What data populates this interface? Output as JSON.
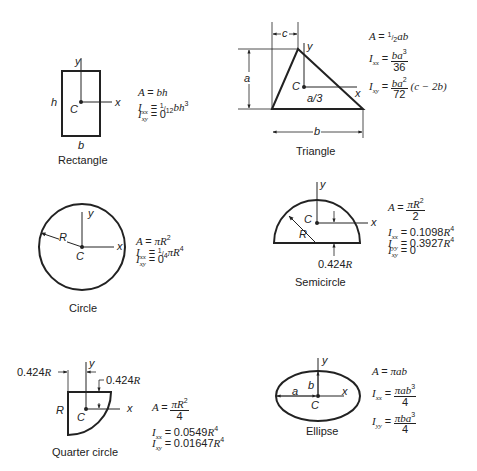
{
  "figure": {
    "shapes": [
      {
        "name": "Rectangle",
        "caption": "Rectangle",
        "labels": {
          "y": "y",
          "x": "x",
          "centroid": "C",
          "height": "h",
          "base": "b"
        },
        "formulas": {
          "A": "A = bh",
          "Ixx": "Ixx = 1/12 bh^3",
          "Ixy": "Ixy = 0"
        }
      },
      {
        "name": "Triangle",
        "caption": "Triangle",
        "labels": {
          "y": "y",
          "x": "x",
          "centroid": "C",
          "offset": "c",
          "height": "a",
          "base": "b",
          "centroid_height": "a/3"
        },
        "formulas": {
          "A": "A = 1/2 ab",
          "Ixx": "Ixx = ba^3 / 36",
          "Ixy": "Ixy = ba^2 / 72 (c − 2b)"
        }
      },
      {
        "name": "Circle",
        "caption": "Circle",
        "labels": {
          "y": "y",
          "x": "x",
          "centroid": "C",
          "radius": "R"
        },
        "formulas": {
          "A": "A = πR^2",
          "Ixx": "Ixx = 1/4 πR^4",
          "Ixy": "Ixy = 0"
        }
      },
      {
        "name": "Semicircle",
        "caption": "Semicircle",
        "labels": {
          "y": "y",
          "x": "x",
          "centroid": "C",
          "radius": "R",
          "centroid_height": "0.424R"
        },
        "formulas": {
          "A": "A = πR^2 / 2",
          "Ixx": "Ixx = 0.1098R^4",
          "Iyy": "Iyy = 0.3927R^4",
          "Ixy": "Ixy = 0"
        }
      },
      {
        "name": "Quarter circle",
        "caption": "Quarter circle",
        "labels": {
          "y": "y",
          "x": "x",
          "centroid": "C",
          "radius": "R",
          "centroid_x": "0.424R",
          "centroid_y": "0.424R"
        },
        "formulas": {
          "A": "A = πR^2 / 4",
          "Ixx": "Ixx = 0.0549R^4",
          "Ixy": "Ixy = 0.01647R^4"
        }
      },
      {
        "name": "Ellipse",
        "caption": "Ellipse",
        "labels": {
          "y": "y",
          "x": "x",
          "centroid": "C",
          "semi_major": "a",
          "semi_minor": "b"
        },
        "formulas": {
          "A": "A = πab",
          "Ixx": "Ixx = πab^3 / 4",
          "Iyy": "Iyy = πba^3 / 4"
        }
      }
    ]
  },
  "text": {
    "rect": {
      "caption": "Rectangle",
      "y": "y",
      "x": "x",
      "c": "C",
      "h": "h",
      "b": "b",
      "A_lhs": "A",
      "A_rhs": "bh",
      "Ixx_I": "I",
      "Ixx_sub": "xx",
      "Ixx_coef_num": "1",
      "Ixx_coef_den": "12",
      "Ixx_rhs": "bh",
      "Ixx_exp": "3",
      "Ixy_I": "I",
      "Ixy_sub": "xy",
      "Ixy_rhs": "0",
      "eq": "="
    },
    "tri": {
      "caption": "Triangle",
      "y": "y",
      "x": "x",
      "c_pt": "C",
      "c": "c",
      "a": "a",
      "b": "b",
      "a3": "a/3",
      "A_lhs": "A",
      "A_coef_num": "1",
      "A_coef_den": "2",
      "A_rhs": "ab",
      "Ixx_I": "I",
      "Ixx_sub": "xx",
      "Ixx_num": "ba",
      "Ixx_num_exp": "3",
      "Ixx_den": "36",
      "Ixy_I": "I",
      "Ixy_sub": "xy",
      "Ixy_num": "ba",
      "Ixy_num_exp": "2",
      "Ixy_den": "72",
      "Ixy_tail": "(c − 2b)",
      "eq": "="
    },
    "circ": {
      "caption": "Circle",
      "y": "y",
      "x": "x",
      "c": "C",
      "r": "R",
      "A_lhs": "A",
      "A_rhs": "πR",
      "A_exp": "2",
      "Ixx_I": "I",
      "Ixx_sub": "xx",
      "Ixx_coef_num": "1",
      "Ixx_coef_den": "4",
      "Ixx_rhs": "πR",
      "Ixx_exp": "4",
      "Ixy_I": "I",
      "Ixy_sub": "xy",
      "Ixy_rhs": "0",
      "eq": "="
    },
    "semi": {
      "caption": "Semicircle",
      "y": "y",
      "x": "x",
      "c": "C",
      "r": "R",
      "dim": "0.424",
      "dim_r": "R",
      "A_lhs": "A",
      "A_num": "πR",
      "A_num_exp": "2",
      "A_den": "2",
      "Ixx_I": "I",
      "Ixx_sub": "xx",
      "Ixx_val": "0.1098",
      "Ixx_r": "R",
      "Ixx_exp": "4",
      "Iyy_I": "I",
      "Iyy_sub": "yy",
      "Iyy_val": "0.3927",
      "Iyy_r": "R",
      "Iyy_exp": "4",
      "Ixy_I": "I",
      "Ixy_sub": "xy",
      "Ixy_rhs": "0",
      "eq": "="
    },
    "quarter": {
      "caption": "Quarter circle",
      "y": "y",
      "x": "x",
      "c": "C",
      "r": "R",
      "dim": "0.424",
      "dim_r": "R",
      "A_lhs": "A",
      "A_num": "πR",
      "A_num_exp": "2",
      "A_den": "4",
      "Ixx_I": "I",
      "Ixx_sub": "xx",
      "Ixx_val": "0.0549",
      "Ixx_r": "R",
      "Ixx_exp": "4",
      "Ixy_I": "I",
      "Ixy_sub": "xy",
      "Ixy_val": "0.01647",
      "Ixy_r": "R",
      "Ixy_exp": "4",
      "eq": "="
    },
    "ellipse": {
      "caption": "Ellipse",
      "y": "y",
      "x": "x",
      "c": "C",
      "a": "a",
      "b": "b",
      "A_lhs": "A",
      "A_rhs": "πab",
      "Ixx_I": "I",
      "Ixx_sub": "xx",
      "Ixx_num": "πab",
      "Ixx_num_exp": "3",
      "Ixx_den": "4",
      "Iyy_I": "I",
      "Iyy_sub": "yy",
      "Iyy_num": "πba",
      "Iyy_num_exp": "3",
      "Iyy_den": "4",
      "eq": "="
    }
  }
}
